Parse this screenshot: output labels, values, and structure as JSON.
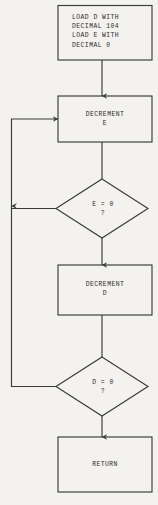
{
  "diagram": {
    "type": "flowchart",
    "background_color": "#f3f2ee",
    "stroke_color": "#3a3a3a",
    "text_color": "#2b2b2b",
    "nodes": [
      {
        "id": "init",
        "shape": "process",
        "lines": [
          "LOAD D WITH",
          "DECIMAL 104",
          "LOAD E WITH",
          "DECIMAL 0"
        ],
        "text": "LOAD D WITH\nDECIMAL 104\nLOAD E WITH\nDECIMAL 0"
      },
      {
        "id": "decrement-e",
        "shape": "process",
        "lines": [
          "DECREMENT",
          "E"
        ],
        "text": "DECREMENT\nE"
      },
      {
        "id": "condition-e",
        "shape": "decision",
        "lines": [
          "E = 0",
          "?"
        ],
        "text": "E = 0\n?"
      },
      {
        "id": "decrement-d",
        "shape": "process",
        "lines": [
          "DECREMENT",
          "D"
        ],
        "text": "DECREMENT\nD"
      },
      {
        "id": "condition-d",
        "shape": "decision",
        "lines": [
          "D = 0",
          "?"
        ],
        "text": "D = 0\n?"
      },
      {
        "id": "return",
        "shape": "process",
        "lines": [
          "RETURN"
        ],
        "text": "RETURN"
      }
    ],
    "edges": [
      {
        "from": "init",
        "to": "decrement-e",
        "label": ""
      },
      {
        "from": "decrement-e",
        "to": "condition-e",
        "label": ""
      },
      {
        "from": "condition-e",
        "to": "decrement-d",
        "label": ""
      },
      {
        "from": "condition-e",
        "to": "decrement-e",
        "label": ""
      },
      {
        "from": "decrement-d",
        "to": "condition-d",
        "label": ""
      },
      {
        "from": "condition-d",
        "to": "return",
        "label": ""
      },
      {
        "from": "condition-d",
        "to": "decrement-e",
        "label": ""
      }
    ]
  }
}
